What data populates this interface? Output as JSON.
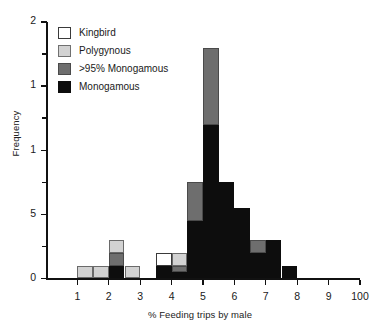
{
  "chart_data": {
    "type": "bar",
    "title": "",
    "subtitle": "",
    "xlabel": "% Feeding trips by male",
    "ylabel": "Frequency",
    "grid": false,
    "stacked": true,
    "legend_position": "top-left",
    "xlim": [
      0,
      10
    ],
    "ylim": [
      0,
      2
    ],
    "bin_width": 0.5,
    "x_tick_labels": [
      "1",
      "2",
      "3",
      "4",
      "5",
      "6",
      "7",
      "8",
      "9",
      "100"
    ],
    "x_tick_values": [
      1,
      2,
      3,
      4,
      5,
      6,
      7,
      8,
      9,
      10
    ],
    "y_tick_labels": [
      "2",
      "1",
      "1",
      "5",
      "0"
    ],
    "y_tick_values": [
      2,
      1.5,
      1,
      0.5,
      0
    ],
    "y_minor_tick_values": [
      1.75,
      1.25,
      0.75,
      0.25
    ],
    "legend": [
      {
        "name": "kingbird",
        "label": "Kingbird",
        "color": "#ffffff"
      },
      {
        "name": "polygynous",
        "label": "Polygynous",
        "color": "#d2d2d2"
      },
      {
        "name": "mono95",
        "label": ">95% Monogamous",
        "color": "#6e6e6e"
      },
      {
        "name": "monogamous",
        "label": "Monogamous",
        "color": "#0d0d0d"
      }
    ],
    "series": [
      {
        "name": "monogamous",
        "label": "Monogamous",
        "values": [
          0,
          0,
          0.1,
          0,
          0,
          0,
          0.1,
          0.05,
          0.45,
          1.2,
          0.75,
          0.55,
          0.2,
          0.3,
          0.1,
          0,
          0,
          0,
          0
        ]
      },
      {
        "name": "mono95",
        "label": ">95% Monogamous",
        "values": [
          0,
          0,
          0.1,
          0,
          0,
          0,
          0,
          0.05,
          0.3,
          0.6,
          0,
          0,
          0.1,
          0,
          0,
          0,
          0,
          0,
          0
        ]
      },
      {
        "name": "polygynous",
        "label": "Polygynous",
        "values": [
          0.1,
          0.1,
          0.1,
          0.1,
          0,
          0,
          0,
          0.1,
          0,
          0,
          0,
          0,
          0,
          0,
          0,
          0,
          0,
          0,
          0
        ]
      },
      {
        "name": "kingbird",
        "label": "Kingbird",
        "values": [
          0,
          0,
          0,
          0,
          0,
          0,
          0.1,
          0,
          0,
          0,
          0,
          0,
          0,
          0,
          0,
          0,
          0,
          0,
          0
        ]
      }
    ],
    "bins": [
      {
        "x0": 1.0,
        "x1": 1.5,
        "segments": [
          {
            "series": "polygynous",
            "value": 0.1
          }
        ],
        "total": 0.1
      },
      {
        "x0": 1.5,
        "x1": 2.0,
        "segments": [
          {
            "series": "polygynous",
            "value": 0.1
          }
        ],
        "total": 0.1
      },
      {
        "x0": 2.0,
        "x1": 2.5,
        "segments": [
          {
            "series": "monogamous",
            "value": 0.1
          },
          {
            "series": "mono95",
            "value": 0.1
          },
          {
            "series": "polygynous",
            "value": 0.1
          }
        ],
        "total": 0.3
      },
      {
        "x0": 2.5,
        "x1": 3.0,
        "segments": [
          {
            "series": "polygynous",
            "value": 0.1
          }
        ],
        "total": 0.1
      },
      {
        "x0": 3.0,
        "x1": 3.5,
        "segments": [],
        "total": 0
      },
      {
        "x0": 3.5,
        "x1": 4.0,
        "segments": [
          {
            "series": "monogamous",
            "value": 0.1
          },
          {
            "series": "kingbird",
            "value": 0.1
          }
        ],
        "total": 0.2
      },
      {
        "x0": 4.0,
        "x1": 4.5,
        "segments": [
          {
            "series": "monogamous",
            "value": 0.05
          },
          {
            "series": "mono95",
            "value": 0.05
          },
          {
            "series": "polygynous",
            "value": 0.1
          }
        ],
        "total": 0.2
      },
      {
        "x0": 4.5,
        "x1": 5.0,
        "segments": [
          {
            "series": "monogamous",
            "value": 0.45
          },
          {
            "series": "mono95",
            "value": 0.3
          }
        ],
        "total": 0.75
      },
      {
        "x0": 5.0,
        "x1": 5.5,
        "segments": [
          {
            "series": "monogamous",
            "value": 1.2
          },
          {
            "series": "mono95",
            "value": 0.6
          }
        ],
        "total": 1.8
      },
      {
        "x0": 5.5,
        "x1": 6.0,
        "segments": [
          {
            "series": "monogamous",
            "value": 0.75
          }
        ],
        "total": 0.75
      },
      {
        "x0": 6.0,
        "x1": 6.5,
        "segments": [
          {
            "series": "monogamous",
            "value": 0.55
          }
        ],
        "total": 0.55
      },
      {
        "x0": 6.5,
        "x1": 7.0,
        "segments": [
          {
            "series": "monogamous",
            "value": 0.2
          },
          {
            "series": "mono95",
            "value": 0.1
          }
        ],
        "total": 0.3
      },
      {
        "x0": 7.0,
        "x1": 7.5,
        "segments": [
          {
            "series": "monogamous",
            "value": 0.3
          }
        ],
        "total": 0.3
      },
      {
        "x0": 7.5,
        "x1": 8.0,
        "segments": [
          {
            "series": "monogamous",
            "value": 0.1
          }
        ],
        "total": 0.1
      },
      {
        "x0": 8.0,
        "x1": 8.5,
        "segments": [],
        "total": 0
      },
      {
        "x0": 8.5,
        "x1": 9.0,
        "segments": [],
        "total": 0
      },
      {
        "x0": 9.0,
        "x1": 9.5,
        "segments": [],
        "total": 0
      },
      {
        "x0": 9.5,
        "x1": 10.0,
        "segments": [],
        "total": 0
      }
    ]
  }
}
